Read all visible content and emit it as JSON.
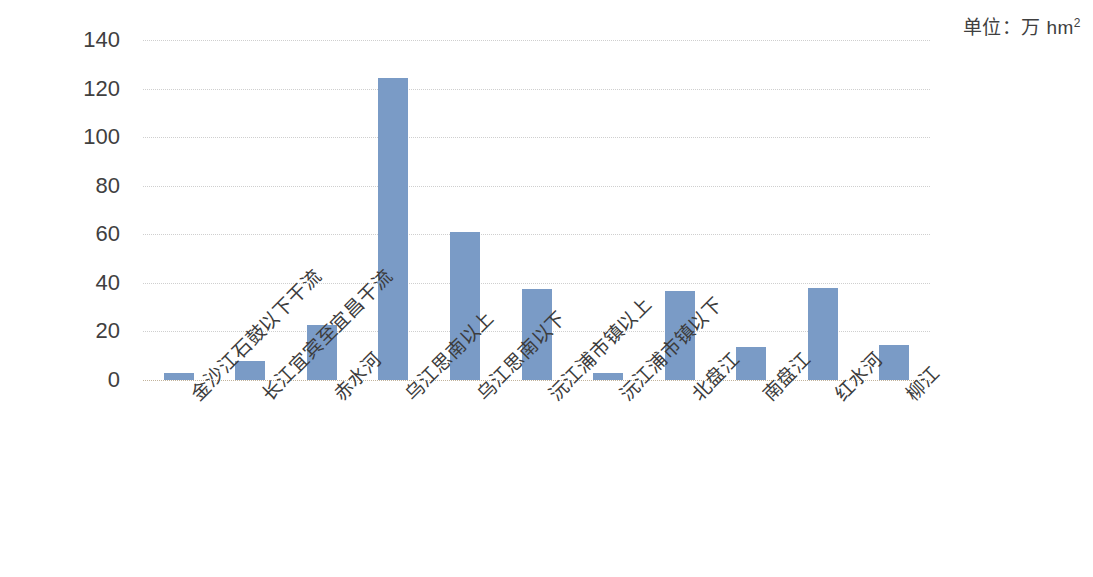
{
  "annotation": {
    "unit_prefix": "单位：万 hm",
    "unit_exponent": "2"
  },
  "chart_data": {
    "type": "bar",
    "title": "",
    "xlabel": "",
    "ylabel": "",
    "unit_note": "单位：万 hm²",
    "ylim": [
      0,
      140
    ],
    "yticks": [
      0,
      20,
      40,
      60,
      80,
      100,
      120,
      140
    ],
    "ytick_labels": [
      "0",
      "20",
      "40",
      "60",
      "80",
      "100",
      "120",
      "140"
    ],
    "grid": true,
    "grid_axis": "y",
    "grid_style": "dotted",
    "legend": false,
    "bar_color": "#7a9bc6",
    "categories": [
      "金沙江石鼓以下干流",
      "长江宜宾至宜昌干流",
      "赤水河",
      "乌江思南以上",
      "乌江思南以下",
      "沅江浦市镇以上",
      "沅江浦市镇以下",
      "北盘江",
      "南盘江",
      "红水河",
      "柳江"
    ],
    "values": [
      3,
      8,
      22.5,
      124.5,
      61,
      37.5,
      3,
      36.5,
      13.5,
      38,
      14.5
    ]
  }
}
